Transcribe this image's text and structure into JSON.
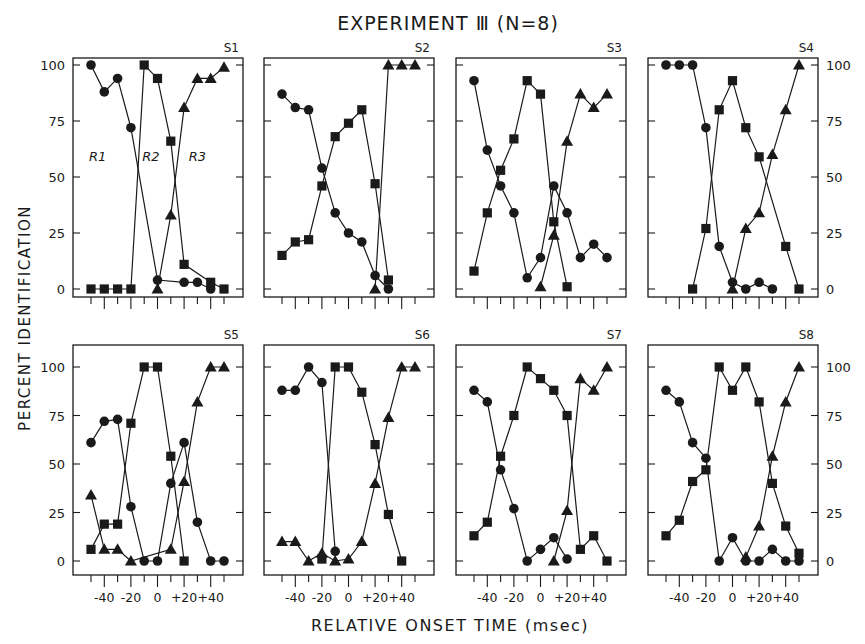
{
  "title": "EXPERIMENT Ⅲ (N=8)",
  "ylabel": "PERCENT IDENTIFICATION",
  "xlabel": "RELATIVE ONSET TIME (msec)",
  "y_ticks": [
    "0",
    "25",
    "50",
    "75",
    "100"
  ],
  "x_tick_labels": [
    "-40",
    "-20",
    "0",
    "+20",
    "+40"
  ],
  "region_labels": [
    "R1",
    "R2",
    "R3"
  ],
  "chart_data": {
    "type": "line",
    "xlabel": "RELATIVE ONSET TIME (msec)",
    "ylabel": "PERCENT IDENTIFICATION",
    "ylim": [
      0,
      100
    ],
    "xlim": [
      -55,
      55
    ],
    "x_ticks": [
      -50,
      -40,
      -30,
      -20,
      -10,
      0,
      10,
      20,
      30,
      40,
      50
    ],
    "markers": {
      "R1": "circle",
      "R2": "square",
      "R3": "triangle"
    },
    "grid": false,
    "panels": [
      {
        "name": "S1",
        "annotations": [
          "R1",
          "R2",
          "R3"
        ],
        "series": [
          {
            "name": "R1",
            "x": [
              -50,
              -40,
              -30,
              -20,
              0,
              20,
              30,
              40
            ],
            "values": [
              100,
              88,
              94,
              72,
              4,
              3,
              3,
              0
            ]
          },
          {
            "name": "R2",
            "x": [
              -50,
              -40,
              -30,
              -20,
              -10,
              0,
              10,
              20,
              40,
              50
            ],
            "values": [
              0,
              0,
              0,
              0,
              100,
              94,
              66,
              11,
              3,
              0
            ]
          },
          {
            "name": "R3",
            "x": [
              0,
              10,
              20,
              30,
              40,
              50
            ],
            "values": [
              0,
              33,
              81,
              94,
              94,
              99
            ]
          }
        ]
      },
      {
        "name": "S2",
        "series": [
          {
            "name": "R1",
            "x": [
              -50,
              -40,
              -30,
              -20,
              -10,
              0,
              10,
              20,
              30
            ],
            "values": [
              87,
              81,
              80,
              54,
              34,
              25,
              21,
              6,
              0
            ]
          },
          {
            "name": "R2",
            "x": [
              -50,
              -40,
              -30,
              -20,
              -10,
              0,
              10,
              20,
              30
            ],
            "values": [
              15,
              21,
              22,
              46,
              68,
              74,
              80,
              47,
              4
            ]
          },
          {
            "name": "R3",
            "x": [
              20,
              30,
              40,
              50
            ],
            "values": [
              0,
              100,
              100,
              100
            ]
          }
        ]
      },
      {
        "name": "S3",
        "series": [
          {
            "name": "R1",
            "x": [
              -50,
              -40,
              -30,
              -20,
              -10,
              0,
              10,
              20,
              30,
              40,
              50
            ],
            "values": [
              93,
              62,
              46,
              34,
              5,
              14,
              46,
              34,
              14,
              20,
              14
            ]
          },
          {
            "name": "R2",
            "x": [
              -50,
              -40,
              -30,
              -20,
              -10,
              0,
              10,
              20
            ],
            "values": [
              8,
              34,
              53,
              67,
              93,
              87,
              30,
              1
            ]
          },
          {
            "name": "R3",
            "x": [
              0,
              10,
              20,
              30,
              40,
              50
            ],
            "values": [
              1,
              24,
              66,
              87,
              81,
              87
            ]
          }
        ]
      },
      {
        "name": "S4",
        "series": [
          {
            "name": "R1",
            "x": [
              -50,
              -40,
              -30,
              -20,
              -10,
              0,
              10,
              20,
              30
            ],
            "values": [
              100,
              100,
              100,
              72,
              19,
              3,
              0,
              3,
              0
            ]
          },
          {
            "name": "R2",
            "x": [
              -30,
              -20,
              -10,
              0,
              10,
              20,
              40,
              50
            ],
            "values": [
              0,
              27,
              80,
              93,
              72,
              59,
              19,
              0
            ]
          },
          {
            "name": "R3",
            "x": [
              0,
              10,
              20,
              30,
              40,
              50
            ],
            "values": [
              0,
              27,
              34,
              60,
              80,
              100
            ]
          }
        ]
      },
      {
        "name": "S5",
        "series": [
          {
            "name": "R1",
            "x": [
              -50,
              -40,
              -30,
              -20,
              -10,
              0,
              10,
              20,
              30,
              40,
              50
            ],
            "values": [
              61,
              72,
              73,
              28,
              0,
              0,
              40,
              61,
              20,
              0,
              0
            ]
          },
          {
            "name": "R2",
            "x": [
              -50,
              -40,
              -30,
              -20,
              -10,
              0,
              10,
              20
            ],
            "values": [
              6,
              19,
              19,
              71,
              100,
              100,
              54,
              0
            ]
          },
          {
            "name": "R3",
            "x": [
              -50,
              -40,
              -30,
              -20,
              10,
              20,
              30,
              40,
              50
            ],
            "values": [
              34,
              6,
              6,
              0,
              6,
              41,
              82,
              100,
              100
            ]
          }
        ]
      },
      {
        "name": "S6",
        "series": [
          {
            "name": "R1",
            "x": [
              -50,
              -40,
              -30,
              -20,
              -10
            ],
            "values": [
              88,
              88,
              100,
              92,
              5
            ]
          },
          {
            "name": "R2",
            "x": [
              -20,
              -10,
              0,
              10,
              20,
              30,
              40
            ],
            "values": [
              1,
              100,
              100,
              87,
              60,
              24,
              0
            ]
          },
          {
            "name": "R3",
            "x": [
              -50,
              -40,
              -30,
              -20,
              -10,
              0,
              10,
              20,
              30,
              40,
              50
            ],
            "values": [
              10,
              10,
              0,
              4,
              0,
              1,
              10,
              40,
              74,
              100,
              100
            ]
          }
        ]
      },
      {
        "name": "S7",
        "series": [
          {
            "name": "R1",
            "x": [
              -50,
              -40,
              -30,
              -20,
              -10,
              0,
              10,
              20
            ],
            "values": [
              88,
              82,
              47,
              27,
              0,
              6,
              12,
              1
            ]
          },
          {
            "name": "R2",
            "x": [
              -50,
              -40,
              -30,
              -20,
              -10,
              0,
              10,
              20,
              30,
              40,
              50
            ],
            "values": [
              13,
              20,
              54,
              75,
              100,
              94,
              88,
              75,
              6,
              13,
              0
            ]
          },
          {
            "name": "R3",
            "x": [
              10,
              20,
              30,
              40,
              50
            ],
            "values": [
              0,
              26,
              94,
              88,
              100
            ]
          }
        ]
      },
      {
        "name": "S8",
        "series": [
          {
            "name": "R1",
            "x": [
              -50,
              -40,
              -30,
              -20,
              -10,
              0,
              10,
              20,
              30,
              40,
              50
            ],
            "values": [
              88,
              82,
              61,
              53,
              0,
              12,
              0,
              0,
              6,
              0,
              0
            ]
          },
          {
            "name": "R2",
            "x": [
              -50,
              -40,
              -30,
              -20,
              -10,
              0,
              10,
              20,
              30,
              40,
              50
            ],
            "values": [
              13,
              21,
              41,
              47,
              100,
              88,
              100,
              82,
              40,
              18,
              4
            ]
          },
          {
            "name": "R3",
            "x": [
              10,
              20,
              30,
              40,
              50
            ],
            "values": [
              2,
              18,
              54,
              82,
              100
            ]
          }
        ]
      }
    ]
  }
}
